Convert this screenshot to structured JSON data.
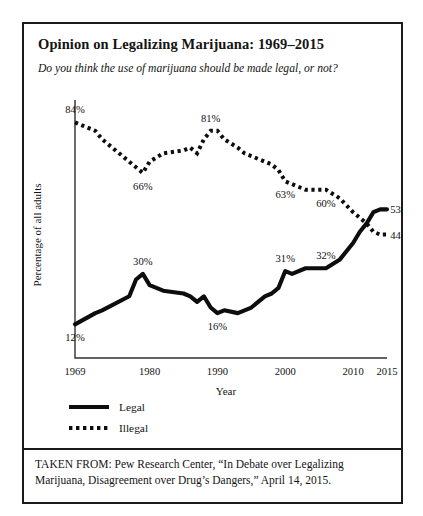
{
  "figure": {
    "title": "Opinion on Legalizing Marijuana: 1969–2015",
    "subtitle": "Do you think the use of marijuana should be made legal, or not?",
    "source_note": "TAKEN FROM: Pew Research Center, “In Debate over Legalizing Marijuana, Disagreement over Drug’s Dangers,” April 14, 2015."
  },
  "legend": {
    "items": [
      {
        "label": "Legal",
        "style": "solid",
        "color": "#0d0d0d"
      },
      {
        "label": "Illegal",
        "style": "dotted",
        "color": "#0d0d0d"
      }
    ]
  },
  "chart_data": {
    "type": "line",
    "title": "Opinion on Legalizing Marijuana: 1969–2015",
    "xlabel": "Year",
    "ylabel": "Percentage of all adults",
    "xlim": [
      1969,
      2015
    ],
    "ylim": [
      0,
      92
    ],
    "grid": false,
    "legend_position": "below-plot-left",
    "xticks": [
      1969,
      1980,
      1990,
      2000,
      2010,
      2015
    ],
    "xtick_labels": [
      "1969",
      "1980",
      "1990",
      "2000",
      "2010",
      "2015"
    ],
    "yticks": [],
    "ytick_labels": [],
    "series": [
      {
        "name": "Legal",
        "style": "solid",
        "color": "#0d0d0d",
        "x": [
          1969,
          1972,
          1973,
          1977,
          1978,
          1979,
          1980,
          1982,
          1985,
          1986,
          1987,
          1988,
          1989,
          1990,
          1991,
          1993,
          1994,
          1995,
          1996,
          1997,
          1998,
          1999,
          2000,
          2001,
          2003,
          2005,
          2006,
          2008,
          2010,
          2011,
          2012,
          2013,
          2014,
          2015
        ],
        "values": [
          12,
          16,
          17,
          22,
          28,
          30,
          26,
          24,
          23,
          22,
          20,
          22,
          18,
          16,
          17,
          16,
          17,
          18,
          20,
          22,
          23,
          25,
          31,
          30,
          32,
          32,
          32,
          35,
          41,
          45,
          48,
          52,
          53,
          53
        ],
        "point_labels": [
          {
            "x": 1969,
            "value": 12,
            "text": "12%",
            "position": "below"
          },
          {
            "x": 1979,
            "value": 30,
            "text": "30%",
            "position": "above"
          },
          {
            "x": 1990,
            "value": 16,
            "text": "16%",
            "position": "below"
          },
          {
            "x": 2000,
            "value": 31,
            "text": "31%",
            "position": "above"
          },
          {
            "x": 2006,
            "value": 32,
            "text": "32%",
            "position": "above"
          },
          {
            "x": 2014,
            "value": 53,
            "text": "53%",
            "position": "right"
          }
        ]
      },
      {
        "name": "Illegal",
        "style": "dotted",
        "color": "#0d0d0d",
        "x": [
          1969,
          1972,
          1973,
          1977,
          1978,
          1979,
          1980,
          1982,
          1985,
          1986,
          1987,
          1988,
          1989,
          1990,
          1991,
          1993,
          1994,
          1995,
          1996,
          1997,
          1998,
          1999,
          2000,
          2001,
          2003,
          2005,
          2006,
          2008,
          2010,
          2011,
          2012,
          2013,
          2014,
          2015
        ],
        "values": [
          84,
          81,
          78,
          70,
          68,
          66,
          70,
          73,
          74,
          75,
          73,
          78,
          81,
          81,
          78,
          75,
          73,
          72,
          71,
          70,
          69,
          67,
          63,
          62,
          60,
          60,
          60,
          57,
          52,
          50,
          48,
          45,
          44,
          44
        ],
        "point_labels": [
          {
            "x": 1969,
            "value": 84,
            "text": "84%",
            "position": "above"
          },
          {
            "x": 1979,
            "value": 66,
            "text": "66%",
            "position": "below"
          },
          {
            "x": 1989,
            "value": 81,
            "text": "81%",
            "position": "above"
          },
          {
            "x": 2000,
            "value": 63,
            "text": "63%",
            "position": "below"
          },
          {
            "x": 2006,
            "value": 60,
            "text": "60%",
            "position": "below"
          },
          {
            "x": 2014,
            "value": 44,
            "text": "44%",
            "position": "right"
          }
        ]
      }
    ]
  }
}
